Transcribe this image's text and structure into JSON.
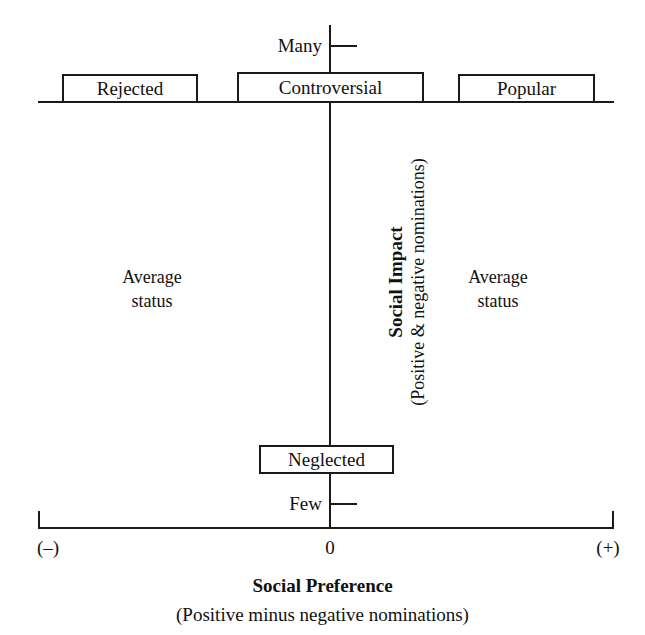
{
  "diagram": {
    "type": "quadrant-scatter-schematic",
    "background_color": "#ffffff",
    "line_color": "#1a1a1a",
    "axes": {
      "y": {
        "title": "Social Impact",
        "subtitle": "(Positive & negative nominations)",
        "high_label": "Many",
        "low_label": "Few",
        "orientation": "vertical",
        "rotation_degrees": -90
      },
      "x": {
        "title": "Social Preference",
        "subtitle": "(Positive minus negative nominations)",
        "low_label": "(–)",
        "origin_label": "0",
        "high_label": "(+)",
        "orientation": "horizontal"
      }
    },
    "category_boxes": [
      {
        "id": "rejected",
        "label": "Rejected",
        "position": "top-left"
      },
      {
        "id": "controversial",
        "label": "Controversial",
        "position": "top-center"
      },
      {
        "id": "popular",
        "label": "Popular",
        "position": "top-right"
      },
      {
        "id": "neglected",
        "label": "Neglected",
        "position": "bottom-center"
      }
    ],
    "quadrant_labels": [
      {
        "id": "average-status-left",
        "line1": "Average",
        "line2": "status",
        "position": "middle-left"
      },
      {
        "id": "average-status-right",
        "line1": "Average",
        "line2": "status",
        "position": "middle-right"
      }
    ]
  },
  "chart_data": {
    "type": "scatter",
    "title": "",
    "xlabel": "Social Preference",
    "ylabel": "Social Impact",
    "xlabel_sub": "(Positive minus negative nominations)",
    "ylabel_sub": "(Positive & negative nominations)",
    "x_tick_labels": [
      "(–)",
      "0",
      "(+)"
    ],
    "y_tick_labels": [
      "Few",
      "Many"
    ],
    "grid": false,
    "legend": "none",
    "annotations": [
      {
        "text": "Rejected",
        "x": "negative",
        "y": "high"
      },
      {
        "text": "Controversial",
        "x": "zero",
        "y": "high"
      },
      {
        "text": "Popular",
        "x": "positive",
        "y": "high"
      },
      {
        "text": "Neglected",
        "x": "zero",
        "y": "low"
      },
      {
        "text": "Average status",
        "x": "negative",
        "y": "middle"
      },
      {
        "text": "Average status",
        "x": "positive",
        "y": "middle"
      }
    ]
  }
}
